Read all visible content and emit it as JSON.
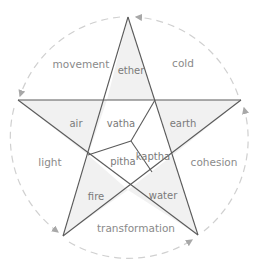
{
  "colors": {
    "line": "#5a5a5a",
    "fill_point": "#f0f0f0",
    "fill_center": "#ffffff",
    "arc": "#cfcfcf",
    "arrow": "#a8a8a8",
    "text": "#8a8a8a"
  },
  "elements": {
    "top": "ether",
    "left": "air",
    "right": "earth",
    "bottom_left": "fire",
    "bottom_right": "water"
  },
  "doshas": {
    "upper_left": "vatha",
    "right": "kaptha",
    "lower": "pitha"
  },
  "qualities": {
    "upper_left": "movement",
    "upper_right": "cold",
    "left": "light",
    "right": "cohesion",
    "bottom": "transformation"
  }
}
